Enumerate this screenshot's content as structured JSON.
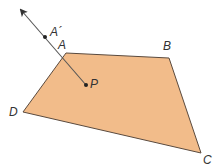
{
  "diagram": {
    "polygon": {
      "fill": "#F2BC8A",
      "stroke": "#5a4a3e",
      "vertices": {
        "A": {
          "x": 66,
          "y": 53
        },
        "B": {
          "x": 169,
          "y": 58
        },
        "C": {
          "x": 201,
          "y": 153
        },
        "D": {
          "x": 23,
          "y": 112
        }
      }
    },
    "points": {
      "P": {
        "x": 86,
        "y": 85
      },
      "A_prime": {
        "x": 45,
        "y": 37
      }
    },
    "ray": {
      "from": "P",
      "through": "A",
      "tip": {
        "x": 21,
        "y": 10
      },
      "color": "#555555"
    },
    "labels": {
      "A": "A",
      "B": "B",
      "C": "C",
      "D": "D",
      "P": "P",
      "A_prime": "A´"
    }
  }
}
